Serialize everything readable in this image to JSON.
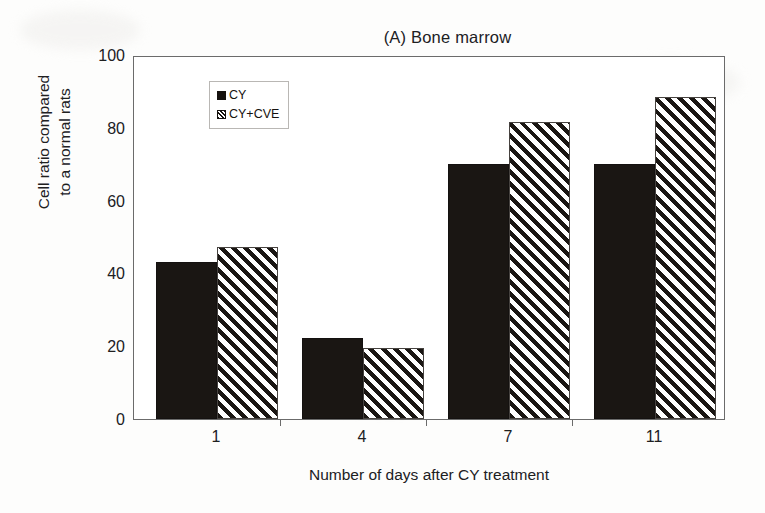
{
  "chart_data": {
    "type": "bar",
    "title": "(A) Bone marrow",
    "xlabel": "Number of days after CY treatment",
    "ylabel": "Cell ratio compared to a normal rats",
    "ylabel_line1": "Cell ratio compared",
    "ylabel_line2": "to a normal rats",
    "categories": [
      "1",
      "4",
      "7",
      "11"
    ],
    "series": [
      {
        "name": "CY",
        "values": [
          43.5,
          22.5,
          70.5,
          70.5
        ],
        "fill": "solid",
        "color": "#1a1613"
      },
      {
        "name": "CY+CVE",
        "values": [
          47.5,
          19.5,
          82.0,
          89.0
        ],
        "fill": "hatched",
        "color": "#1a1613"
      }
    ],
    "ylim": [
      0,
      100
    ],
    "yticks": [
      0,
      20,
      40,
      60,
      80,
      100
    ],
    "ytick_labels": [
      "0",
      "20",
      "40",
      "60",
      "80",
      "100"
    ],
    "grid": false,
    "legend_position": "upper-left-inside",
    "frame_color": "#6b6b6b",
    "background_color": "#ffffff"
  },
  "legend": {
    "items": [
      {
        "label": "CY",
        "swatch": "solid-square-icon"
      },
      {
        "label": "CY+CVE",
        "swatch": "hatched-square-icon"
      }
    ]
  }
}
